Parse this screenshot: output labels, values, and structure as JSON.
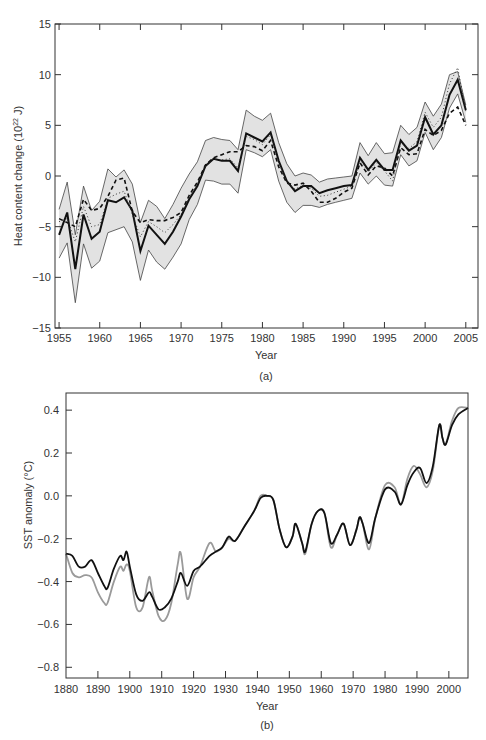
{
  "chart_data": [
    {
      "id": "a",
      "type": "line",
      "caption": "(a)",
      "title": "",
      "xlabel": "Year",
      "ylabel": "Heat content change (10^22 J)",
      "ylabel_main": "Heat content change (10",
      "ylabel_sup": "22",
      "ylabel_end": " J)",
      "xlim": [
        1954.5,
        2006.5
      ],
      "ylim": [
        -15,
        15
      ],
      "xticks": [
        1955,
        1960,
        1965,
        1970,
        1975,
        1980,
        1985,
        1990,
        1995,
        2000,
        2005
      ],
      "yticks": [
        -15,
        -10,
        -5,
        0,
        5,
        10,
        15
      ],
      "grid": false,
      "legend": "none",
      "x": [
        1955,
        1956,
        1957,
        1958,
        1959,
        1960,
        1961,
        1962,
        1963,
        1964,
        1965,
        1966,
        1967,
        1968,
        1969,
        1970,
        1971,
        1972,
        1973,
        1974,
        1975,
        1976,
        1977,
        1978,
        1979,
        1980,
        1981,
        1982,
        1983,
        1984,
        1985,
        1986,
        1987,
        1988,
        1989,
        1990,
        1991,
        1992,
        1993,
        1994,
        1995,
        1996,
        1997,
        1998,
        1999,
        2000,
        2001,
        2002,
        2003,
        2004,
        2005
      ],
      "series": [
        {
          "name": "mean (solid)",
          "style": "solid",
          "values": [
            -5.8,
            -3.6,
            -9.2,
            -3.8,
            -6.2,
            -5.5,
            -2.4,
            -2.6,
            -2.1,
            -3.4,
            -7.4,
            -4.9,
            -5.8,
            -6.7,
            -5.5,
            -4.0,
            -2.3,
            -1.0,
            1.0,
            1.7,
            1.5,
            1.5,
            0.5,
            4.2,
            3.8,
            3.4,
            4.3,
            1.5,
            -0.5,
            -1.5,
            -1.0,
            -1.0,
            -1.7,
            -1.4,
            -1.2,
            -1.0,
            -0.9,
            1.8,
            0.6,
            1.6,
            0.6,
            0.6,
            3.5,
            2.5,
            3.0,
            5.8,
            4.1,
            5.0,
            8.0,
            9.5,
            6.5
          ]
        },
        {
          "name": "upper bound",
          "style": "band",
          "values": [
            -3.3,
            -0.6,
            -5.8,
            -1.0,
            -3.4,
            -2.5,
            0.7,
            -0.1,
            0.6,
            -0.8,
            -4.6,
            -2.4,
            -3.0,
            -4.2,
            -2.8,
            -1.2,
            0.2,
            1.4,
            3.5,
            3.8,
            3.6,
            3.5,
            2.6,
            6.5,
            5.9,
            5.5,
            6.2,
            3.3,
            1.2,
            0.0,
            0.3,
            0.1,
            -0.6,
            -0.3,
            -0.2,
            -0.1,
            0.0,
            3.3,
            2.0,
            3.3,
            2.2,
            2.3,
            5.0,
            4.1,
            4.8,
            7.3,
            5.9,
            7.1,
            10.0,
            10.3,
            7.0
          ]
        },
        {
          "name": "lower bound",
          "style": "band",
          "values": [
            -8.1,
            -6.6,
            -12.5,
            -6.7,
            -9.1,
            -8.4,
            -5.6,
            -5.3,
            -5.0,
            -6.5,
            -10.3,
            -7.3,
            -8.5,
            -9.2,
            -8.0,
            -6.7,
            -4.3,
            -2.8,
            -0.4,
            -0.5,
            -0.8,
            -0.8,
            -1.7,
            2.6,
            2.3,
            1.9,
            2.6,
            -0.5,
            -2.6,
            -3.6,
            -2.9,
            -2.9,
            -3.1,
            -2.8,
            -2.6,
            -2.4,
            -2.2,
            0.3,
            -0.8,
            0.0,
            -0.9,
            -1.0,
            2.1,
            1.0,
            1.5,
            4.3,
            2.6,
            3.8,
            6.7,
            8.1,
            5.3
          ]
        },
        {
          "name": "dashed estimate",
          "style": "dashed",
          "values": [
            -4.2,
            -4.6,
            -5.0,
            -2.3,
            -3.4,
            -3.2,
            -2.0,
            -0.4,
            -0.2,
            -3.5,
            -4.6,
            -4.3,
            -4.4,
            -4.4,
            -4.1,
            -3.6,
            -1.9,
            -0.6,
            1.1,
            1.8,
            2.1,
            2.4,
            2.4,
            3.0,
            2.9,
            2.5,
            3.5,
            0.9,
            -0.7,
            -0.9,
            -0.7,
            -1.5,
            -2.6,
            -2.6,
            -2.2,
            -1.6,
            -1.2,
            1.3,
            0.1,
            1.0,
            0.8,
            0.0,
            2.8,
            2.1,
            2.2,
            4.6,
            4.0,
            4.5,
            6.2,
            6.8,
            5.0
          ]
        },
        {
          "name": "dotted estimate",
          "style": "dotted",
          "values": [
            -4.5,
            -4.2,
            -6.5,
            -3.0,
            -5.0,
            -4.8,
            -2.2,
            -1.8,
            -1.5,
            -3.8,
            -6.0,
            -4.5,
            -5.0,
            -5.6,
            -4.8,
            -3.8,
            -2.1,
            -0.8,
            1.0,
            1.7,
            1.6,
            1.7,
            0.8,
            3.9,
            3.6,
            3.1,
            4.1,
            1.3,
            -0.6,
            -1.3,
            -0.9,
            -1.2,
            -2.0,
            -1.9,
            -1.6,
            -1.3,
            -1.0,
            1.6,
            0.4,
            1.3,
            0.5,
            -0.5,
            3.3,
            2.7,
            3.4,
            6.3,
            4.8,
            5.8,
            9.1,
            10.7,
            6.4
          ]
        }
      ]
    },
    {
      "id": "b",
      "type": "line",
      "caption": "(b)",
      "title": "",
      "xlabel": "Year",
      "ylabel": "SST anomaly (°C)",
      "xlim": [
        1880,
        2006
      ],
      "ylim": [
        -0.85,
        0.48
      ],
      "xticks": [
        1880,
        1890,
        1900,
        1910,
        1920,
        1930,
        1940,
        1950,
        1960,
        1970,
        1980,
        1990,
        2000
      ],
      "yticks": [
        -0.8,
        -0.6,
        -0.4,
        -0.2,
        0.0,
        0.2,
        0.4
      ],
      "ytick_labels": [
        "−0.8",
        "−0.6",
        "−0.4",
        "−0.2",
        "0.0",
        "0.2",
        "0.4"
      ],
      "grid": false,
      "legend": "none",
      "x": [
        1880,
        1882,
        1884,
        1886,
        1888,
        1890,
        1892,
        1893,
        1895,
        1897,
        1898,
        1899,
        1900,
        1902,
        1904,
        1906,
        1907,
        1909,
        1911,
        1913,
        1915,
        1916,
        1918,
        1920,
        1922,
        1925,
        1927,
        1929,
        1931,
        1933,
        1936,
        1939,
        1941,
        1943,
        1945,
        1947,
        1949,
        1951,
        1952,
        1954,
        1955,
        1957,
        1959,
        1961,
        1963,
        1965,
        1967,
        1969,
        1971,
        1972,
        1973,
        1975,
        1977,
        1980,
        1983,
        1985,
        1987,
        1989,
        1991,
        1993,
        1995,
        1997,
        1998,
        1999,
        2001,
        2003,
        2006
      ],
      "series": [
        {
          "name": "black (solid dark)",
          "color": "#111111",
          "values": [
            -0.27,
            -0.28,
            -0.33,
            -0.33,
            -0.3,
            -0.36,
            -0.42,
            -0.43,
            -0.34,
            -0.28,
            -0.3,
            -0.26,
            -0.33,
            -0.46,
            -0.49,
            -0.45,
            -0.47,
            -0.53,
            -0.52,
            -0.48,
            -0.4,
            -0.36,
            -0.42,
            -0.35,
            -0.33,
            -0.28,
            -0.26,
            -0.24,
            -0.19,
            -0.21,
            -0.14,
            -0.07,
            -0.01,
            -0.0,
            -0.02,
            -0.16,
            -0.24,
            -0.19,
            -0.13,
            -0.22,
            -0.26,
            -0.13,
            -0.07,
            -0.08,
            -0.22,
            -0.18,
            -0.13,
            -0.23,
            -0.16,
            -0.1,
            -0.13,
            -0.22,
            -0.1,
            0.03,
            0.02,
            -0.04,
            0.05,
            0.11,
            0.13,
            0.06,
            0.14,
            0.33,
            0.27,
            0.24,
            0.33,
            0.38,
            0.41
          ]
        },
        {
          "name": "gray (solid light)",
          "color": "#9a9a9a",
          "values": [
            -0.27,
            -0.36,
            -0.38,
            -0.37,
            -0.38,
            -0.45,
            -0.5,
            -0.5,
            -0.4,
            -0.33,
            -0.35,
            -0.32,
            -0.35,
            -0.52,
            -0.52,
            -0.38,
            -0.44,
            -0.56,
            -0.58,
            -0.5,
            -0.32,
            -0.27,
            -0.48,
            -0.38,
            -0.33,
            -0.22,
            -0.26,
            -0.24,
            -0.2,
            -0.21,
            -0.14,
            -0.07,
            -0.0,
            -0.0,
            -0.02,
            -0.16,
            -0.24,
            -0.19,
            -0.13,
            -0.22,
            -0.27,
            -0.13,
            -0.07,
            -0.08,
            -0.24,
            -0.18,
            -0.13,
            -0.23,
            -0.16,
            -0.1,
            -0.13,
            -0.25,
            -0.1,
            0.05,
            0.04,
            -0.04,
            0.08,
            0.14,
            0.1,
            0.04,
            0.12,
            0.33,
            0.27,
            0.24,
            0.35,
            0.41,
            0.41
          ]
        }
      ]
    }
  ]
}
